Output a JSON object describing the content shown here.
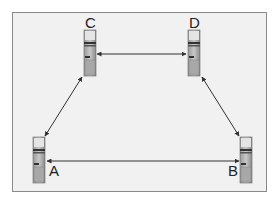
{
  "diagram": {
    "nodes": [
      {
        "id": "A",
        "label": "A"
      },
      {
        "id": "B",
        "label": "B"
      },
      {
        "id": "C",
        "label": "C"
      },
      {
        "id": "D",
        "label": "D"
      }
    ],
    "edges": [
      {
        "from": "C",
        "to": "D",
        "direction": "bidirectional"
      },
      {
        "from": "C",
        "to": "A",
        "direction": "bidirectional"
      },
      {
        "from": "D",
        "to": "B",
        "direction": "bidirectional"
      },
      {
        "from": "A",
        "to": "B",
        "direction": "bidirectional"
      }
    ],
    "node_icon": "computer-tower-icon"
  }
}
